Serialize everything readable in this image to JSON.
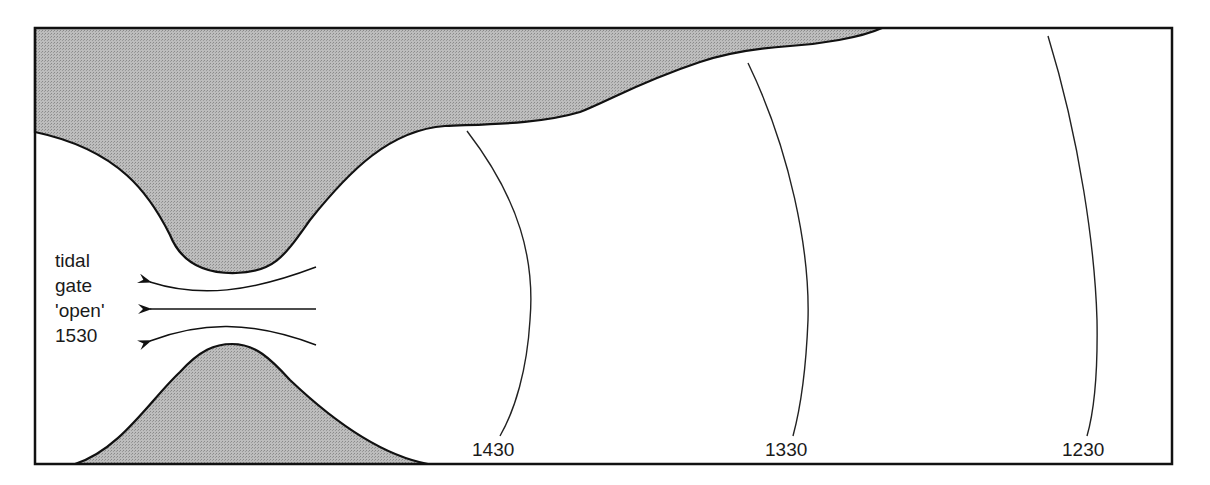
{
  "diagram": {
    "title": "",
    "gate_label": {
      "lines": [
        "tidal",
        "gate",
        "'open'",
        "1530"
      ]
    },
    "time_contours": [
      {
        "label": "1430"
      },
      {
        "label": "1330"
      },
      {
        "label": "1230"
      }
    ],
    "colors": {
      "land": "#b4b4b4",
      "water": "#ffffff",
      "outline": "#111111"
    }
  }
}
